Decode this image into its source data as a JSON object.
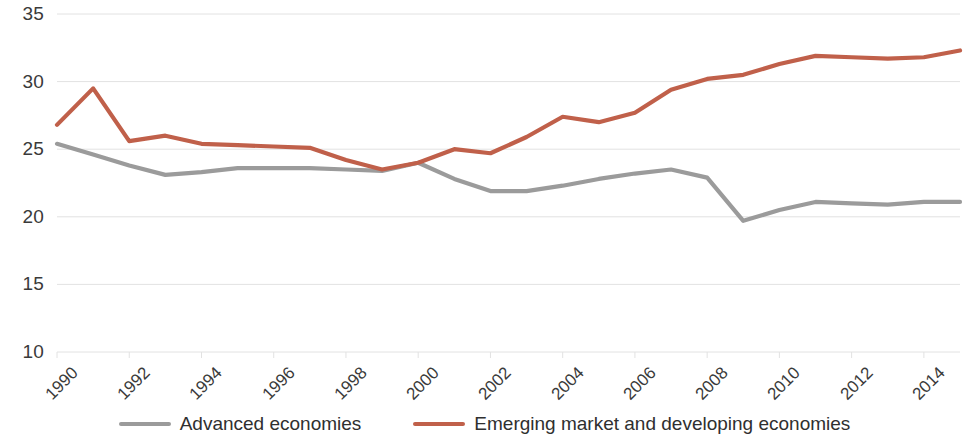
{
  "chart_data": {
    "type": "line",
    "title": "",
    "subtitle": "",
    "xlabel": "",
    "ylabel": "",
    "xlim": [
      1990,
      2015
    ],
    "ylim": [
      10,
      35
    ],
    "y_ticks": [
      10,
      15,
      20,
      25,
      30,
      35
    ],
    "y_tick_labels": [
      "10",
      "15",
      "20",
      "25",
      "30",
      "35"
    ],
    "x_ticks": [
      1990,
      1992,
      1994,
      1996,
      1998,
      2000,
      2002,
      2004,
      2006,
      2008,
      2010,
      2012,
      2014
    ],
    "x_tick_labels": [
      "1990",
      "1992",
      "1994",
      "1996",
      "1998",
      "2000",
      "2002",
      "2004",
      "2006",
      "2008",
      "2010",
      "2012",
      "2014"
    ],
    "x": [
      1990,
      1991,
      1992,
      1993,
      1994,
      1995,
      1996,
      1997,
      1998,
      1999,
      2000,
      2001,
      2002,
      2003,
      2004,
      2005,
      2006,
      2007,
      2008,
      2009,
      2010,
      2011,
      2012,
      2013,
      2014,
      2015
    ],
    "grid": "horizontal",
    "legend_position": "bottom",
    "series": [
      {
        "name": "Advanced economies",
        "color": "#9b9b9b",
        "values": [
          25.4,
          24.6,
          23.8,
          23.1,
          23.3,
          23.6,
          23.6,
          23.6,
          23.5,
          23.4,
          24.0,
          22.8,
          21.9,
          21.9,
          22.3,
          22.8,
          23.2,
          23.5,
          22.9,
          19.7,
          20.5,
          21.1,
          21.0,
          20.9,
          21.1,
          21.1
        ]
      },
      {
        "name": "Emerging market and developing economies",
        "color": "#c0604a",
        "values": [
          26.8,
          29.5,
          25.6,
          26.0,
          25.4,
          25.3,
          25.2,
          25.1,
          24.2,
          23.5,
          24.0,
          25.0,
          24.7,
          25.9,
          27.4,
          27.0,
          27.7,
          29.4,
          30.2,
          30.5,
          31.3,
          31.9,
          31.8,
          31.7,
          31.8,
          32.3
        ]
      }
    ]
  },
  "legend": {
    "items": [
      {
        "label": "Advanced economies",
        "color": "#9b9b9b"
      },
      {
        "label": "Emerging market and developing economies",
        "color": "#c0604a"
      }
    ]
  },
  "axis": {
    "y_labels": [
      "35",
      "30",
      "25",
      "20",
      "15",
      "10"
    ],
    "x_labels": [
      "1990",
      "1992",
      "1994",
      "1996",
      "1998",
      "2000",
      "2002",
      "2004",
      "2006",
      "2008",
      "2010",
      "2012",
      "2014"
    ]
  },
  "colors": {
    "advanced": "#9b9b9b",
    "emerging": "#c0604a",
    "gridline": "#e2e2e2",
    "text": "#3a3a3a",
    "background": "#ffffff"
  }
}
